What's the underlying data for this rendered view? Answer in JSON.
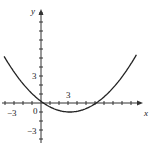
{
  "chart_data": {
    "type": "line",
    "title": "",
    "xlabel": "x",
    "ylabel": "y",
    "equation_approx": "y = 0.116(x - 3.2)^2 - 1",
    "xlim": [
      -4.5,
      11
    ],
    "ylim": [
      -4,
      11
    ],
    "x_tick_labels": [
      "-3",
      "0",
      "3"
    ],
    "y_tick_labels": [
      "3",
      "-3"
    ],
    "grid": false,
    "series": [
      {
        "name": "parabola",
        "x": [
          -4,
          -3,
          -2,
          -1,
          0,
          1,
          2,
          3,
          3.2,
          4,
          5,
          6,
          7,
          8,
          9,
          10,
          10.5
        ],
        "y": [
          5.0,
          3.46,
          2.14,
          1.05,
          0.19,
          -0.44,
          -0.83,
          -1.0,
          -1.0,
          -0.93,
          -0.62,
          -0.09,
          0.68,
          1.67,
          2.9,
          4.36,
          5.18
        ]
      }
    ],
    "color": "#222222"
  },
  "labels": {
    "x_axis": "x",
    "y_axis": "y",
    "origin": "0",
    "x_neg3": "−3",
    "x_pos3": "3",
    "y_pos3": "3",
    "y_neg3": "−3"
  }
}
